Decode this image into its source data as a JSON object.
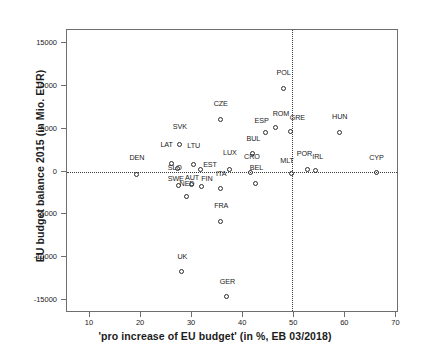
{
  "chart_data": {
    "type": "scatter",
    "title": "",
    "xlabel": "'pro increase of EU budget' (in %, EB 03/2018)",
    "ylabel": "EU budget balance 2015 (in Mio. EUR)",
    "xlim": [
      5.5,
      70.5
    ],
    "ylim": [
      -16500,
      16500
    ],
    "xticks": [
      10,
      20,
      30,
      40,
      50,
      60,
      70
    ],
    "yticks": [
      15000,
      10000,
      5000,
      0,
      -5000,
      -10000,
      -15000
    ],
    "xtick_labels": [
      "10",
      "20",
      "30",
      "40",
      "50",
      "60",
      "70"
    ],
    "ytick_labels": [
      "15000",
      "10000",
      "5000",
      "0",
      "-5000",
      "-10000",
      "-15000"
    ],
    "grid": false,
    "legend": "none",
    "reference_lines": {
      "horizontal_y": 0,
      "vertical_x": 49.5,
      "style": "dotted"
    },
    "point_style": {
      "marker": "open-circle",
      "color": "#2b2b2b",
      "size": 5
    },
    "points": [
      {
        "label": "DEN",
        "x": 19.2,
        "y": -400,
        "lx": 19.2,
        "ly": 1100
      },
      {
        "label": "LAT",
        "x": 26.0,
        "y": 900,
        "lx": 25.0,
        "ly": 2600
      },
      {
        "label": "SVK",
        "x": 27.6,
        "y": 3100,
        "lx": 27.6,
        "ly": 4700
      },
      {
        "label": "SLO",
        "x": 27.2,
        "y": 300,
        "lx": 26.6,
        "ly": -100
      },
      {
        "label": "SWE",
        "x": 27.5,
        "y": -1700,
        "lx": 26.8,
        "ly": -1300
      },
      {
        "label": "NED",
        "x": 29.0,
        "y": -3000,
        "lx": 29.0,
        "ly": -1900
      },
      {
        "label": "LTU",
        "x": 30.3,
        "y": 700,
        "lx": 30.3,
        "ly": 2500
      },
      {
        "label": "AUT",
        "x": 29.9,
        "y": -1600,
        "lx": 30.0,
        "ly": -1200
      },
      {
        "label": "EST",
        "x": 31.8,
        "y": 200,
        "lx": 33.5,
        "ly": 250
      },
      {
        "label": "FIN",
        "x": 31.9,
        "y": -1800,
        "lx": 32.9,
        "ly": -1350
      },
      {
        "label": "FRA",
        "x": 35.7,
        "y": -5900,
        "lx": 35.7,
        "ly": -4500
      },
      {
        "label": "CZE",
        "x": 35.6,
        "y": 6000,
        "lx": 35.6,
        "ly": 7400
      },
      {
        "label": "ITA",
        "x": 35.7,
        "y": -2000,
        "lx": 35.7,
        "ly": -700
      },
      {
        "label": "LUX",
        "x": 37.4,
        "y": 200,
        "lx": 37.4,
        "ly": 1700
      },
      {
        "label": "UK",
        "x": 28.1,
        "y": -11700,
        "lx": 28.1,
        "ly": -10400
      },
      {
        "label": "GER",
        "x": 36.9,
        "y": -14600,
        "lx": 36.9,
        "ly": -13300
      },
      {
        "label": "BUL",
        "x": 42.0,
        "y": 2000,
        "lx": 42.0,
        "ly": 3300
      },
      {
        "label": "CRO",
        "x": 41.5,
        "y": -200,
        "lx": 41.7,
        "ly": 1250
      },
      {
        "label": "BEL",
        "x": 42.6,
        "y": -1500,
        "lx": 42.6,
        "ly": -100
      },
      {
        "label": "ESP",
        "x": 44.5,
        "y": 4500,
        "lx": 43.6,
        "ly": 5400
      },
      {
        "label": "ROM",
        "x": 46.4,
        "y": 5100,
        "lx": 47.4,
        "ly": 6200
      },
      {
        "label": "GRE",
        "x": 49.4,
        "y": 4600,
        "lx": 50.6,
        "ly": 5800
      },
      {
        "label": "POL",
        "x": 47.9,
        "y": 9600,
        "lx": 47.9,
        "ly": 11000
      },
      {
        "label": "MLT",
        "x": 49.5,
        "y": -250,
        "lx": 48.6,
        "ly": 800
      },
      {
        "label": "POR",
        "x": 52.6,
        "y": 150,
        "lx": 52.0,
        "ly": 1550
      },
      {
        "label": "IRL",
        "x": 54.2,
        "y": 100,
        "lx": 54.6,
        "ly": 1250
      },
      {
        "label": "HUN",
        "x": 58.9,
        "y": 4500,
        "lx": 58.9,
        "ly": 5900
      },
      {
        "label": "CYP",
        "x": 66.1,
        "y": -200,
        "lx": 66.1,
        "ly": 1100
      }
    ]
  }
}
